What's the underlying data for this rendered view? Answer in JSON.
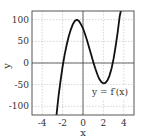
{
  "chart_data": {
    "type": "line",
    "title": "",
    "xlabel": "x",
    "ylabel": "y",
    "xlim": [
      -5,
      5
    ],
    "ylim": [
      -120,
      120
    ],
    "grid": true,
    "xticks": [
      "-4",
      "-2",
      "0",
      "2",
      "4"
    ],
    "yticks": [
      "100",
      "50",
      "0",
      "-50",
      "-100"
    ],
    "annotations": [
      {
        "text": "y = f′(x)",
        "x": 2.7,
        "y": -65
      }
    ],
    "series": [
      {
        "name": "y = f′(x)",
        "x": [
          -2.6,
          -2.4,
          -2.2,
          -2.0,
          -1.8,
          -1.6,
          -1.4,
          -1.2,
          -1.0,
          -0.8,
          -0.6,
          -0.4,
          -0.2,
          0.0,
          0.2,
          0.4,
          0.6,
          0.8,
          1.0,
          1.2,
          1.4,
          1.6,
          1.8,
          2.0,
          2.2,
          2.4,
          2.6,
          2.8,
          3.0,
          3.2,
          3.4,
          3.6,
          3.8
        ],
        "values": [
          -120,
          -77,
          -40,
          -8,
          19,
          42,
          61,
          77,
          89,
          97,
          100,
          97,
          89,
          80,
          67,
          52,
          36,
          19,
          3,
          -12,
          -26,
          -37,
          -44,
          -47,
          -46,
          -40,
          -29,
          -12,
          10,
          38,
          71,
          108,
          130
        ]
      }
    ]
  },
  "labels": {
    "xlabel": "x",
    "ylabel": "y",
    "curve_label": "y = f′(x)",
    "xticks": [
      "-4",
      "-2",
      "0",
      "2",
      "4"
    ],
    "yticks": [
      "100",
      "50",
      "0",
      "-50",
      "-100"
    ]
  }
}
